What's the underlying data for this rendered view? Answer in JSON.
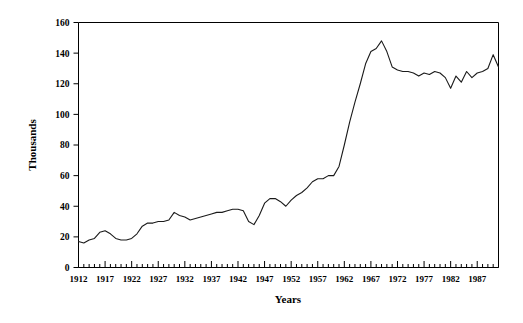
{
  "chart_data": {
    "type": "line",
    "title": "",
    "xlabel": "Years",
    "ylabel": "Thousands",
    "xlim": [
      1912,
      1991
    ],
    "ylim": [
      0,
      160
    ],
    "grid": false,
    "legend": null,
    "y_ticks": [
      0,
      20,
      40,
      60,
      80,
      100,
      120,
      140,
      160
    ],
    "x_ticks": [
      1912,
      1917,
      1922,
      1927,
      1932,
      1937,
      1942,
      1947,
      1952,
      1957,
      1962,
      1967,
      1972,
      1977,
      1982,
      1987
    ],
    "x_minor_tick_interval": 1,
    "x": [
      1912,
      1913,
      1914,
      1915,
      1916,
      1917,
      1918,
      1919,
      1920,
      1921,
      1922,
      1923,
      1924,
      1925,
      1926,
      1927,
      1928,
      1929,
      1930,
      1931,
      1932,
      1933,
      1934,
      1935,
      1936,
      1937,
      1938,
      1939,
      1940,
      1941,
      1942,
      1943,
      1944,
      1945,
      1946,
      1947,
      1948,
      1949,
      1950,
      1951,
      1952,
      1953,
      1954,
      1955,
      1956,
      1957,
      1958,
      1959,
      1960,
      1961,
      1962,
      1963,
      1964,
      1965,
      1966,
      1967,
      1968,
      1969,
      1970,
      1971,
      1972,
      1973,
      1974,
      1975,
      1976,
      1977,
      1978,
      1979,
      1980,
      1981,
      1982,
      1983,
      1984,
      1985,
      1986,
      1987,
      1988,
      1989,
      1990,
      1991
    ],
    "values": [
      17,
      16,
      18,
      19,
      23,
      24,
      22,
      19,
      18,
      18,
      19,
      22,
      27,
      29,
      29,
      30,
      30,
      31,
      36,
      34,
      33,
      31,
      32,
      33,
      34,
      35,
      36,
      36,
      37,
      38,
      38,
      37,
      30,
      28,
      34,
      42,
      45,
      45,
      43,
      40,
      44,
      47,
      49,
      52,
      56,
      58,
      58,
      60,
      60,
      66,
      80,
      95,
      108,
      120,
      133,
      141,
      143,
      148,
      141,
      131,
      129,
      128,
      128,
      127,
      125,
      127,
      126,
      128,
      127,
      124,
      117,
      125,
      121,
      128,
      124,
      127,
      128,
      130,
      139,
      131
    ],
    "series_name": "values",
    "line_color": "#1a1a1a",
    "line_width": 1.1
  },
  "axes": {
    "y_axis_label": "Thousands",
    "x_axis_label": "Years",
    "y_tick_labels": [
      "0",
      "20",
      "40",
      "60",
      "80",
      "100",
      "120",
      "140",
      "160"
    ],
    "x_tick_labels": [
      "1912",
      "1917",
      "1922",
      "1927",
      "1932",
      "1937",
      "1942",
      "1947",
      "1952",
      "1957",
      "1962",
      "1967",
      "1972",
      "1977",
      "1982",
      "1987"
    ]
  },
  "style": {
    "background": "#ffffff",
    "axis_color": "#000000",
    "text_color": "#000000"
  }
}
